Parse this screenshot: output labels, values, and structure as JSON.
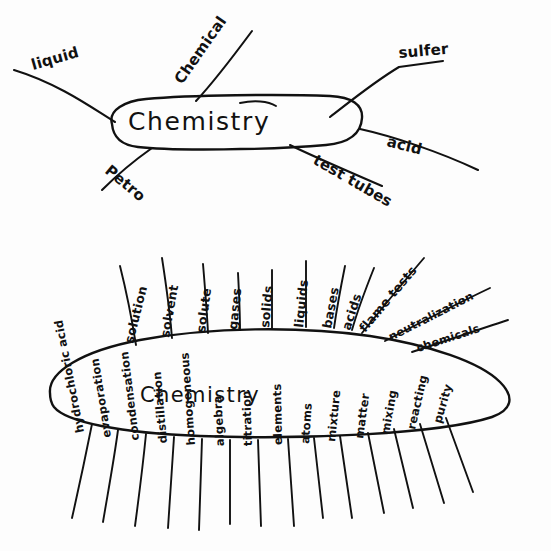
{
  "image": {
    "kind": "hand-drawn-mind-map-photo",
    "background_color": "#fdfdfd",
    "ink_color": "#111111"
  },
  "map_top": {
    "center_label": "Chemistry",
    "branches": [
      {
        "id": "liquid",
        "label": "liquid"
      },
      {
        "id": "chemical",
        "label": "Chemical"
      },
      {
        "id": "sulfer",
        "label": "sulfer"
      },
      {
        "id": "acid",
        "label": "acid"
      },
      {
        "id": "test-tubes",
        "label": "test tubes"
      },
      {
        "id": "petro",
        "label": "Petro"
      }
    ]
  },
  "map_bottom": {
    "center_label": "Chemistry",
    "branches_top": [
      {
        "id": "solution",
        "label": "solution"
      },
      {
        "id": "solvent",
        "label": "solvent"
      },
      {
        "id": "solute",
        "label": "solute"
      },
      {
        "id": "gases",
        "label": "gases"
      },
      {
        "id": "solids",
        "label": "solids"
      },
      {
        "id": "liquids",
        "label": "liquids"
      },
      {
        "id": "bases",
        "label": "bases"
      },
      {
        "id": "acids",
        "label": "acids"
      },
      {
        "id": "flame-tests",
        "label": "flame tests"
      },
      {
        "id": "neutralization",
        "label": "neutralization"
      },
      {
        "id": "chemicals",
        "label": "chemicals"
      }
    ],
    "branches_bottom": [
      {
        "id": "hydrochloric-acid",
        "label": "hydrochloric acid"
      },
      {
        "id": "evaporation",
        "label": "evaporation"
      },
      {
        "id": "condensation",
        "label": "condensation"
      },
      {
        "id": "distillation",
        "label": "distillation"
      },
      {
        "id": "homogeneous",
        "label": "homogeneous"
      },
      {
        "id": "algebra",
        "label": "algebra"
      },
      {
        "id": "titration",
        "label": "titration"
      },
      {
        "id": "elements",
        "label": "elements"
      },
      {
        "id": "atoms",
        "label": "atoms"
      },
      {
        "id": "mixture",
        "label": "mixture"
      },
      {
        "id": "matter",
        "label": "matter"
      },
      {
        "id": "mixing",
        "label": "mixing"
      },
      {
        "id": "reacting",
        "label": "reacting"
      },
      {
        "id": "purity",
        "label": "purity"
      }
    ]
  }
}
